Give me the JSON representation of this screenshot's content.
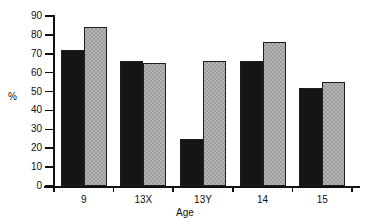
{
  "chart_data": {
    "type": "bar",
    "title": "",
    "xlabel": "Age",
    "ylabel": "%",
    "categories": [
      "9",
      "13X",
      "13Y",
      "14",
      "15"
    ],
    "series": [
      {
        "name": "series-1",
        "color": "#151515",
        "values": [
          72,
          66,
          25,
          66,
          52
        ]
      },
      {
        "name": "series-2",
        "color": "#b4b4b4",
        "values": [
          84,
          65,
          66,
          76,
          55
        ]
      }
    ],
    "ylim": [
      0,
      90
    ],
    "yticks": [
      0,
      10,
      20,
      30,
      40,
      50,
      60,
      70,
      80,
      90
    ],
    "ytick_labels": [
      "0",
      "10",
      "20",
      "30",
      "40",
      "50",
      "60",
      "70",
      "80",
      "90"
    ],
    "grid": false,
    "legend": "none"
  }
}
